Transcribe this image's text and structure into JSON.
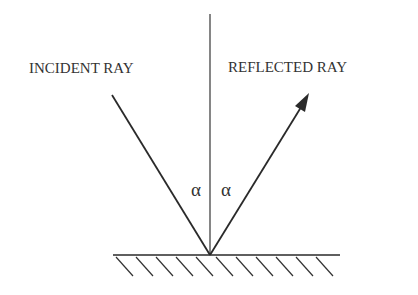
{
  "labels": {
    "incident": "INCIDENT RAY",
    "reflected": "REFLECTED RAY",
    "angle_left": "α",
    "angle_right": "α"
  },
  "colors": {
    "line": "#2a2a2a",
    "text": "#333333"
  }
}
